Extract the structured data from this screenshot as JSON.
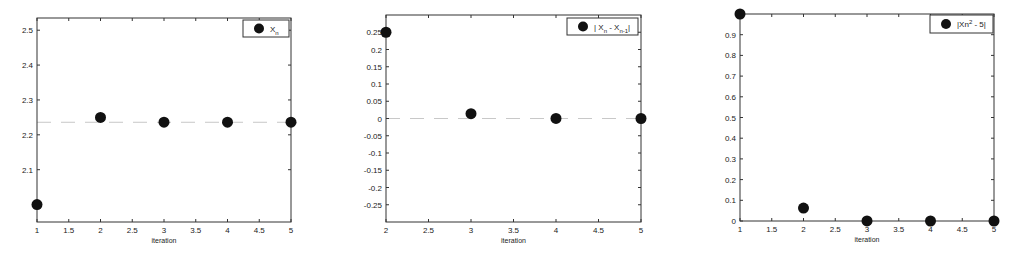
{
  "chart_data": [
    {
      "type": "scatter",
      "title": "",
      "xlabel": "iteration",
      "ylabel": "",
      "xlim": [
        1,
        5
      ],
      "ylim": [
        1.95,
        2.535
      ],
      "xticks": [
        1,
        1.5,
        2,
        2.5,
        3,
        3.5,
        4,
        4.5,
        5
      ],
      "xtick_labels": [
        "1",
        "1.5",
        "2",
        "2.5",
        "3",
        "3.5",
        "4",
        "4.5",
        "5"
      ],
      "yticks": [
        2.1,
        2.2,
        2.3,
        2.4,
        2.5
      ],
      "ytick_labels": [
        "2.1",
        "2.2",
        "2.3",
        "2.4",
        "2.5"
      ],
      "grid": false,
      "legend_position": "upper right",
      "reference_line": {
        "y": 2.236,
        "style": "dashed",
        "color": "#c8c8c8"
      },
      "series": [
        {
          "name": "X_n",
          "legend_label": "Xn",
          "x": [
            1,
            2,
            3,
            4,
            5
          ],
          "values": [
            2.0,
            2.25,
            2.2361,
            2.2361,
            2.2361
          ]
        }
      ],
      "box": {
        "left": 37,
        "top": 18,
        "right": 291,
        "bottom": 222
      },
      "legend_box": {
        "x": 243,
        "y": 20,
        "w": 46,
        "h": 17
      }
    },
    {
      "type": "scatter",
      "title": "",
      "xlabel": "iteration",
      "ylabel": "",
      "xlim": [
        2,
        5
      ],
      "ylim": [
        -0.3,
        0.3
      ],
      "xticks": [
        2,
        2.5,
        3,
        3.5,
        4,
        4.5,
        5
      ],
      "xtick_labels": [
        "2",
        "2.5",
        "3",
        "3.5",
        "4",
        "4.5",
        "5"
      ],
      "yticks": [
        -0.25,
        -0.2,
        -0.15,
        -0.1,
        -0.05,
        0,
        0.05,
        0.1,
        0.15,
        0.2,
        0.25
      ],
      "ytick_labels": [
        "-0.25",
        "-0.2",
        "-0.15",
        "-0.1",
        "-0.05",
        "0",
        "0.05",
        "0.1",
        "0.15",
        "0.2",
        "0.25"
      ],
      "grid": false,
      "legend_position": "upper right",
      "reference_line": {
        "y": 0,
        "style": "dashed",
        "color": "#c8c8c8"
      },
      "series": [
        {
          "name": "|X_n - X_n-1|",
          "legend_label": "| Xn - Xn-1|",
          "x": [
            2,
            3,
            4,
            5
          ],
          "values": [
            0.25,
            0.014,
            0.0003,
            0.0
          ]
        }
      ],
      "box": {
        "left": 386,
        "top": 15,
        "right": 641,
        "bottom": 222
      },
      "legend_box": {
        "x": 567,
        "y": 18,
        "w": 71,
        "h": 17
      }
    },
    {
      "type": "scatter",
      "title": "",
      "xlabel": "iteration",
      "ylabel": "",
      "xlim": [
        1,
        5
      ],
      "ylim": [
        0,
        1
      ],
      "xticks": [
        1,
        1.5,
        2,
        2.5,
        3,
        3.5,
        4,
        4.5,
        5
      ],
      "xtick_labels": [
        "1",
        "1.5",
        "2",
        "2.5",
        "3",
        "3.5",
        "4",
        "4.5",
        "5"
      ],
      "yticks": [
        0,
        0.1,
        0.2,
        0.3,
        0.4,
        0.5,
        0.6,
        0.7,
        0.8,
        0.9
      ],
      "ytick_labels": [
        "0",
        "0.1",
        "0.2",
        "0.3",
        "0.4",
        "0.5",
        "0.6",
        "0.7",
        "0.8",
        "0.9"
      ],
      "grid": false,
      "legend_position": "upper right",
      "series": [
        {
          "name": "|Xn^2 - 5|",
          "legend_label": "|Xn² - 5|",
          "x": [
            1,
            2,
            3,
            4,
            5
          ],
          "values": [
            1.0,
            0.0625,
            0.0002,
            0.0,
            0.0
          ]
        }
      ],
      "box": {
        "left": 740,
        "top": 14,
        "right": 994,
        "bottom": 221
      },
      "legend_box": {
        "x": 930,
        "y": 15,
        "w": 63,
        "h": 18
      }
    }
  ],
  "colors": {
    "marker": "#111111",
    "axis": "#333333",
    "ref_line": "#c8c8c8"
  }
}
